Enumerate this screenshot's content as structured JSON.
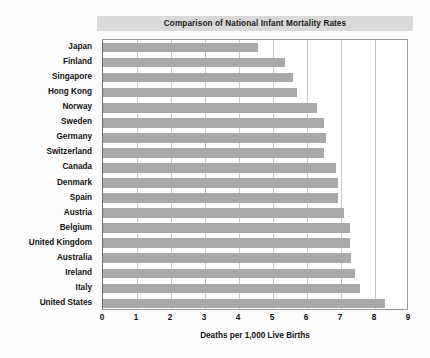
{
  "chart_data": {
    "type": "bar",
    "orientation": "horizontal",
    "title": "Comparison of National Infant Mortality Rates",
    "xlabel": "Deaths per 1,000 Live Births",
    "ylabel": "",
    "xlim": [
      0,
      9
    ],
    "xticks": [
      0,
      1,
      2,
      3,
      4,
      5,
      6,
      7,
      8,
      9
    ],
    "xtick_labels": [
      "0",
      "1",
      "2",
      "3",
      "4",
      "5",
      "6",
      "7",
      "8",
      "9"
    ],
    "grid": "vertical",
    "legend": "none",
    "bar_color": "#a9a9a9",
    "title_band_color": "#d9d9d9",
    "gridline_color": "#c9c9c9",
    "plot_border_color": "#9a9a9a",
    "categories": [
      "Japan",
      "Finland",
      "Singapore",
      "Hong Kong",
      "Norway",
      "Sweden",
      "Germany",
      "Switzerland",
      "Canada",
      "Denmark",
      "Spain",
      "Austria",
      "Belgium",
      "United Kingdom",
      "Australia",
      "Ireland",
      "Italy",
      "United States"
    ],
    "values": [
      4.55,
      5.35,
      5.6,
      5.7,
      6.3,
      6.5,
      6.55,
      6.5,
      6.85,
      6.9,
      6.9,
      7.1,
      7.25,
      7.25,
      7.3,
      7.4,
      7.55,
      8.3
    ]
  }
}
